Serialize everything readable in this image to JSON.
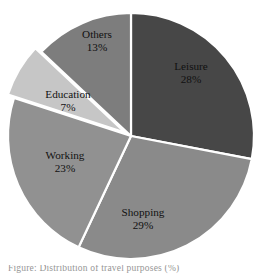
{
  "chart_data": {
    "type": "pie",
    "title": "",
    "subtitle": "",
    "xlabel": "",
    "ylabel": "",
    "legend_position": "none",
    "grid": false,
    "units": "percent",
    "start_angle_deg": 0,
    "direction": "clockwise",
    "categories": [
      "Leisure",
      "Shopping",
      "Working",
      "Education",
      "Others"
    ],
    "values": [
      28,
      29,
      23,
      7,
      13
    ],
    "slices": [
      {
        "label": "Leisure",
        "value": 28,
        "value_label": "28%",
        "color": "#474747",
        "exploded": false,
        "start_deg": 0,
        "end_deg": 100.8,
        "label_x": 191,
        "label_y": 70,
        "value_x": 191,
        "value_y": 83
      },
      {
        "label": "Shopping",
        "value": 29,
        "value_label": "29%",
        "color": "#8a8a8a",
        "exploded": false,
        "start_deg": 100.8,
        "end_deg": 205.2,
        "label_x": 143,
        "label_y": 216,
        "value_x": 143,
        "value_y": 229
      },
      {
        "label": "Working",
        "value": 23,
        "value_label": "23%",
        "color": "#919191",
        "exploded": false,
        "start_deg": 205.2,
        "end_deg": 288.0,
        "label_x": 65,
        "label_y": 159,
        "value_x": 65,
        "value_y": 172
      },
      {
        "label": "Education",
        "value": 7,
        "value_label": "7%",
        "color": "#c6c6c6",
        "exploded": true,
        "start_deg": 288.0,
        "end_deg": 313.2,
        "label_x": 68,
        "label_y": 98,
        "value_x": 68,
        "value_y": 111
      },
      {
        "label": "Others",
        "value": 13,
        "value_label": "13%",
        "color": "#7d7d7d",
        "exploded": false,
        "start_deg": 313.2,
        "end_deg": 360.0,
        "label_x": 97,
        "label_y": 38,
        "value_x": 97,
        "value_y": 51
      }
    ],
    "geometry": {
      "center_x": 131,
      "center_y": 136,
      "radius": 123,
      "explode_offset": 7,
      "separator_color": "#ffffff",
      "separator_width": 2.2
    }
  },
  "caption": {
    "text": "Figure: Distribution of travel purposes (%)"
  }
}
